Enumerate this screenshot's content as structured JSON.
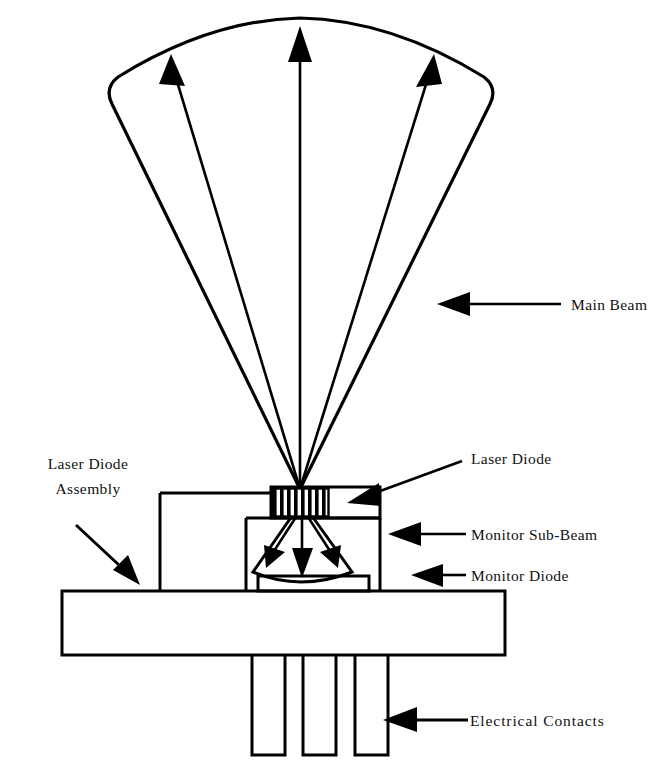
{
  "figure": {
    "background_color": "#ffffff",
    "line_color": "#000000"
  },
  "labels": {
    "main_beam": "Main Beam",
    "laser_diode": "Laser Diode",
    "laser_diode_assembly_line1": "Laser Diode",
    "laser_diode_assembly_line2": "Assembly",
    "monitor_sub_beam": "Monitor Sub-Beam",
    "monitor_diode": "Monitor Diode",
    "electrical_contacts": "Electrical Contacts"
  },
  "components": {
    "main_beam_cone": "main-beam-cone",
    "laser_diode_chip": "laser-diode-chip",
    "monitor_sub_beam_cone": "monitor-sub-beam-cone",
    "monitor_diode_chip": "monitor-diode-chip",
    "assembly_body": "assembly-body",
    "base_plate": "base-plate",
    "electrical_pin_count": 3
  },
  "beam_arrows": {
    "main_beam_ray_count": 3,
    "monitor_sub_beam_ray_count": 3,
    "main_beam_direction": "up",
    "monitor_sub_beam_direction": "down"
  }
}
